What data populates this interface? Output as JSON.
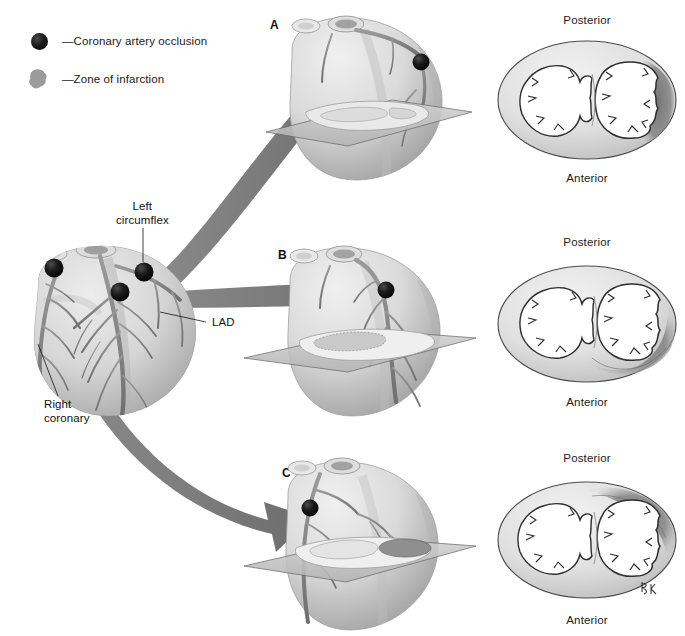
{
  "figure": {
    "artist_signature": "RK"
  },
  "legend": {
    "items": [
      {
        "icon": "occlusion-dot",
        "label": "—Coronary artery occlusion",
        "color": "#101010"
      },
      {
        "icon": "infarct-blob",
        "label": "—Zone of infarction",
        "color": "#9a9a9a"
      }
    ]
  },
  "overview_heart": {
    "name": "anterior-heart-overview",
    "labels": [
      {
        "id": "left-circumflex",
        "text_line1": "Left",
        "text_line2": "circumflex"
      },
      {
        "id": "lad",
        "text_line1": "LAD",
        "text_line2": ""
      },
      {
        "id": "right-coronary",
        "text_line1": "Right",
        "text_line2": "coronary"
      }
    ],
    "occlusion_points": [
      {
        "id": "occlusion-left-circumflex"
      },
      {
        "id": "occlusion-lad"
      },
      {
        "id": "occlusion-right-coronary"
      }
    ]
  },
  "panels": [
    {
      "letter": "A",
      "name": "panel-a",
      "artery": "Left circumflex",
      "cross_section": {
        "name": "cross-section-a",
        "top_label": "Posterior",
        "bottom_label": "Anterior",
        "infarct_region": "lateral-posterolateral-left-ventricle"
      }
    },
    {
      "letter": "B",
      "name": "panel-b",
      "artery": "LAD",
      "cross_section": {
        "name": "cross-section-b",
        "top_label": "Posterior",
        "bottom_label": "Anterior",
        "infarct_region": "anterior-anteroseptal-left-ventricle"
      }
    },
    {
      "letter": "C",
      "name": "panel-c",
      "artery": "Right coronary",
      "cross_section": {
        "name": "cross-section-c",
        "top_label": "Posterior",
        "bottom_label": "Anterior",
        "infarct_region": "posterior-inferior-left-ventricle"
      }
    }
  ],
  "colors": {
    "arrow": "#7c7c7c",
    "arrow_dark": "#6e6e6e",
    "heart_body": "#d8d8d8",
    "heart_shadow": "#a9a9a9",
    "vessel": "#8a8a8a",
    "infarct": "#8f8f8f",
    "plane": "#c2c2c2",
    "outline": "#3a3a3a",
    "text": "#111111"
  }
}
